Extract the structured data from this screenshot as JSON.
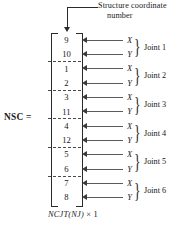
{
  "figure": {
    "callout": {
      "line1": "Structure coordinate",
      "line2": "number"
    },
    "matrix_name": "NSC =",
    "caption_dims": "NCJT(NJ)",
    "caption_times": "× 1",
    "entries": [
      {
        "value": "9",
        "axis": "X",
        "joint": "Joint 1"
      },
      {
        "value": "10",
        "axis": "Y",
        "joint": "Joint 1"
      },
      {
        "value": "1",
        "axis": "X",
        "joint": "Joint 2"
      },
      {
        "value": "2",
        "axis": "Y",
        "joint": "Joint 2"
      },
      {
        "value": "3",
        "axis": "X",
        "joint": "Joint 3"
      },
      {
        "value": "11",
        "axis": "Y",
        "joint": "Joint 3"
      },
      {
        "value": "4",
        "axis": "X",
        "joint": "Joint 4"
      },
      {
        "value": "12",
        "axis": "Y",
        "joint": "Joint 4"
      },
      {
        "value": "5",
        "axis": "X",
        "joint": "Joint 5"
      },
      {
        "value": "6",
        "axis": "Y",
        "joint": "Joint 5"
      },
      {
        "value": "7",
        "axis": "X",
        "joint": "Joint 6"
      },
      {
        "value": "8",
        "axis": "Y",
        "joint": "Joint 6"
      }
    ],
    "joints": [
      "Joint 1",
      "Joint 2",
      "Joint 3",
      "Joint 4",
      "Joint 5",
      "Joint 6"
    ],
    "brace_glyph": "}",
    "colors": {
      "ink": "#1a1a1a",
      "rule": "#2a2a2a",
      "arrow": "#5b5b5b",
      "background": "#ffffff"
    }
  }
}
